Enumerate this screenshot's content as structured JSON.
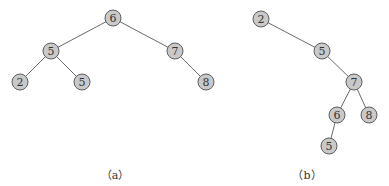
{
  "trees": [
    {
      "caption": "（a）",
      "caption_pos": [
        115,
        166
      ],
      "nodes": [
        {
          "label": "6",
          "x": 113,
          "y": 18
        },
        {
          "label": "5",
          "x": 51,
          "y": 51
        },
        {
          "label": "7",
          "x": 175,
          "y": 51
        },
        {
          "label": "2",
          "x": 20,
          "y": 82
        },
        {
          "label": "5",
          "x": 82,
          "y": 82
        },
        {
          "label": "8",
          "x": 206,
          "y": 82
        }
      ],
      "edges": [
        [
          0,
          1
        ],
        [
          0,
          2
        ],
        [
          1,
          3
        ],
        [
          1,
          4
        ],
        [
          2,
          5
        ]
      ]
    },
    {
      "caption": "（b）",
      "caption_pos": [
        307,
        166
      ],
      "nodes": [
        {
          "label": "2",
          "x": 261,
          "y": 19
        },
        {
          "label": "5",
          "x": 322,
          "y": 51
        },
        {
          "label": "7",
          "x": 354,
          "y": 82
        },
        {
          "label": "6",
          "x": 337,
          "y": 115
        },
        {
          "label": "8",
          "x": 369,
          "y": 115
        },
        {
          "label": "5",
          "x": 329,
          "y": 146
        }
      ],
      "edges": [
        [
          0,
          1
        ],
        [
          1,
          2
        ],
        [
          2,
          3
        ],
        [
          2,
          4
        ],
        [
          3,
          5
        ]
      ]
    }
  ],
  "style": {
    "node_fill": "#c9c9c9",
    "node_stroke": "#5e5e5e",
    "edge_color": "#6a6a6a",
    "node_radius": 8
  }
}
